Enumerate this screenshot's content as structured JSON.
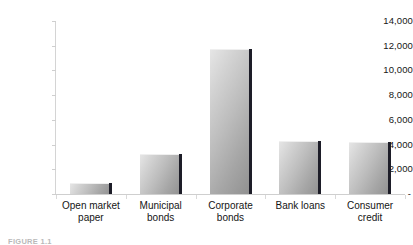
{
  "chart_data": {
    "type": "bar",
    "title": "",
    "subtitle": "",
    "xlabel": "",
    "ylabel": "",
    "categories": [
      "Open market\npaper",
      "Municipal\nbonds",
      "Corporate\nbonds",
      "Bank loans",
      "Consumer\ncredit"
    ],
    "values": [
      900,
      3200,
      11700,
      4250,
      4220
    ],
    "ylim": [
      0,
      14000
    ],
    "ytick_values": [
      0,
      2000,
      4000,
      6000,
      8000,
      10000,
      12000,
      14000
    ],
    "ytick_labels": [
      "-",
      "2,000",
      "4,000",
      "6,000",
      "8,000",
      "10,000",
      "12,000",
      "14,000"
    ],
    "grid": false,
    "legend": "none",
    "bar_fill_light": "#e6e6e6",
    "bar_fill_dark": "#8f8f8f",
    "bar_edge_color": "#1d1d28",
    "axis_color": "#cfcfcf",
    "background_color": "#ffffff"
  },
  "caption": {
    "text": "FIGURE 1.1"
  }
}
